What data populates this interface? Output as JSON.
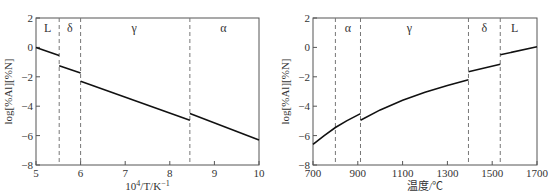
{
  "chart_data": [
    {
      "type": "line",
      "xlabel": "10^4/T/K^-1",
      "xlabel_parts": {
        "base": "10",
        "sup": "4",
        "mid": "/T/K",
        "sup2": "−1"
      },
      "ylabel": "log[%Al][%N]",
      "xlim": [
        5,
        10
      ],
      "ylim": [
        -8,
        2
      ],
      "xticks": [
        5,
        6,
        7,
        8,
        9,
        10
      ],
      "yticks": [
        2,
        0,
        -2,
        -4,
        -6,
        -8
      ],
      "grid": false,
      "phase_boundaries": [
        5.52,
        6.0,
        8.45
      ],
      "phase_labels": [
        {
          "label": "L",
          "x": 5.26
        },
        {
          "label": "δ",
          "x": 5.76
        },
        {
          "label": "γ",
          "x": 7.2
        },
        {
          "label": "α",
          "x": 9.2
        }
      ],
      "series": [
        {
          "name": "L",
          "x": [
            5.0,
            5.52
          ],
          "y": [
            0.0,
            -0.55
          ]
        },
        {
          "name": "δ",
          "x": [
            5.52,
            6.0
          ],
          "y": [
            -1.25,
            -1.75
          ]
        },
        {
          "name": "γ",
          "x": [
            6.0,
            8.45
          ],
          "y": [
            -2.3,
            -4.95
          ]
        },
        {
          "name": "α",
          "x": [
            8.45,
            10.0
          ],
          "y": [
            -4.5,
            -6.3
          ]
        }
      ]
    },
    {
      "type": "line",
      "xlabel": "温度/℃",
      "ylabel": "log[%Al][%N]",
      "xlim": [
        700,
        1700
      ],
      "ylim": [
        -8,
        2
      ],
      "xticks": [
        700,
        900,
        1100,
        1300,
        1500,
        1700
      ],
      "yticks": [
        2,
        0,
        -2,
        -4,
        -6,
        -8
      ],
      "grid": false,
      "phase_boundaries": [
        800,
        912,
        1394,
        1536
      ],
      "phase_labels": [
        {
          "label": "α",
          "x": 856
        },
        {
          "label": "γ",
          "x": 1130
        },
        {
          "label": "δ",
          "x": 1465
        },
        {
          "label": "L",
          "x": 1600
        }
      ],
      "series": [
        {
          "name": "α",
          "x": [
            700,
            750,
            800,
            850,
            912
          ],
          "y": [
            -6.6,
            -6.0,
            -5.45,
            -5.0,
            -4.5
          ]
        },
        {
          "name": "γ",
          "x": [
            912,
            1000,
            1100,
            1200,
            1300,
            1394
          ],
          "y": [
            -4.95,
            -4.25,
            -3.6,
            -3.05,
            -2.6,
            -2.2
          ]
        },
        {
          "name": "δ",
          "x": [
            1394,
            1536
          ],
          "y": [
            -1.65,
            -1.15
          ]
        },
        {
          "name": "L",
          "x": [
            1536,
            1700
          ],
          "y": [
            -0.5,
            0.05
          ]
        }
      ]
    }
  ]
}
